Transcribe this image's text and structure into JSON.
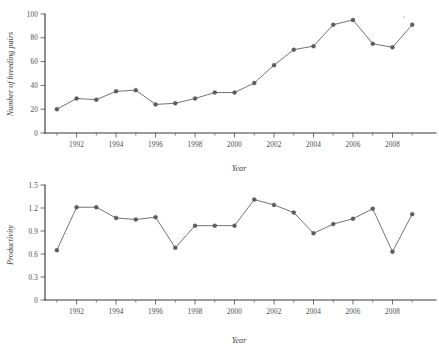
{
  "figure": {
    "background": "#ffffff",
    "line_color": "#6b6b6b",
    "marker_color": "#5e5e5e",
    "axis_color": "#3a3a3a",
    "text_color": "#4b4b4b"
  },
  "chart_data": [
    {
      "id": "breeding-pairs",
      "type": "line",
      "title": "",
      "xlabel": "Year",
      "ylabel": "Number of breeding pairs",
      "xlim": [
        1990.4,
        2009.8
      ],
      "ylim": [
        0,
        100
      ],
      "grid": false,
      "legend": "none",
      "marker": "filled-circle",
      "x": [
        1991,
        1992,
        1993,
        1994,
        1995,
        1996,
        1997,
        1998,
        1999,
        2000,
        2001,
        2002,
        2003,
        2004,
        2005,
        2006,
        2007,
        2008,
        2009
      ],
      "values": [
        20,
        29,
        28,
        35,
        36,
        24,
        25,
        29,
        34,
        34,
        42,
        57,
        70,
        73,
        91,
        95,
        75,
        72,
        91
      ],
      "yticks": [
        0,
        20,
        40,
        60,
        80,
        100
      ],
      "yticklabels": [
        "0",
        "20",
        "40",
        "60",
        "80",
        "100"
      ],
      "xticks": [
        1992,
        1994,
        1996,
        1998,
        2000,
        2002,
        2004,
        2006,
        2008
      ],
      "xticklabels": [
        "1992",
        "1994",
        "1996",
        "1998",
        "2000",
        "2002",
        "2004",
        "2006",
        "2008"
      ],
      "xminorticks": [
        1991,
        1993,
        1995,
        1997,
        1999,
        2001,
        2003,
        2005,
        2007,
        2009
      ]
    },
    {
      "id": "productivity",
      "type": "line",
      "title": "",
      "xlabel": "Year",
      "ylabel": "Productivity",
      "xlim": [
        1990.4,
        2009.8
      ],
      "ylim": [
        0,
        1.5
      ],
      "grid": false,
      "legend": "none",
      "marker": "filled-circle",
      "x": [
        1991,
        1992,
        1993,
        1994,
        1995,
        1996,
        1997,
        1998,
        1999,
        2000,
        2001,
        2002,
        2003,
        2004,
        2005,
        2006,
        2007,
        2008,
        2009
      ],
      "values": [
        0.65,
        1.21,
        1.21,
        1.07,
        1.05,
        1.08,
        0.68,
        0.97,
        0.97,
        0.97,
        1.31,
        1.24,
        1.14,
        0.87,
        0.99,
        1.06,
        1.19,
        0.63,
        1.12
      ],
      "yticks": [
        0,
        0.3,
        0.6,
        0.9,
        1.2,
        1.5
      ],
      "yticklabels": [
        "0",
        "0.3",
        "0.6",
        "0.9",
        "1.2",
        "1.5"
      ],
      "xticks": [
        1992,
        1994,
        1996,
        1998,
        2000,
        2002,
        2004,
        2006,
        2008
      ],
      "xticklabels": [
        "1992",
        "1994",
        "1996",
        "1998",
        "2000",
        "2002",
        "2004",
        "2006",
        "2008"
      ],
      "xminorticks": [
        1991,
        1993,
        1995,
        1997,
        1999,
        2001,
        2003,
        2005,
        2007,
        2009
      ]
    }
  ]
}
